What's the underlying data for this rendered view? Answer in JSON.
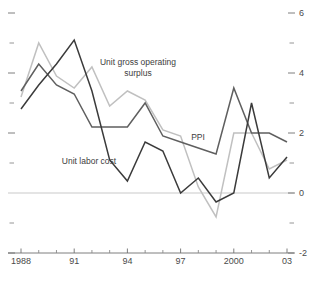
{
  "chart_data": {
    "type": "line",
    "title": "",
    "subtitle": "",
    "xlabel": "",
    "ylabel": "",
    "xlim": [
      1988,
      2003
    ],
    "ylim": [
      -2,
      6
    ],
    "grid": false,
    "legend_position": "inline-annotations",
    "x_tick_labels": [
      "1988",
      "91",
      "94",
      "97",
      "2000",
      "03"
    ],
    "x_tick_values": [
      1988,
      1991,
      1994,
      1997,
      2000,
      2003
    ],
    "x_minor_ticks": [
      1989,
      1990,
      1992,
      1993,
      1995,
      1996,
      1998,
      1999,
      2001,
      2002
    ],
    "y_tick_labels": [
      "6",
      "4",
      "2",
      "0",
      "-2"
    ],
    "y_tick_values": [
      6,
      4,
      2,
      0,
      -2
    ],
    "y_minor_ticks": [
      5,
      3,
      1,
      -1
    ],
    "x": [
      1988,
      1989,
      1990,
      1991,
      1992,
      1993,
      1994,
      1995,
      1996,
      1997,
      1998,
      1999,
      2000,
      2001,
      2002,
      2003
    ],
    "series": [
      {
        "name": "Unit gross operating surplus",
        "color": "#c0c0c0",
        "values": [
          3.2,
          5.0,
          3.9,
          3.5,
          4.2,
          2.9,
          3.4,
          3.1,
          2.1,
          1.9,
          0.2,
          -0.8,
          2.0,
          2.0,
          0.8,
          1.1
        ]
      },
      {
        "name": "Unit labor cost",
        "color": "#5f5f5f",
        "values": [
          3.4,
          4.3,
          3.6,
          3.3,
          2.2,
          2.2,
          2.2,
          3.0,
          1.9,
          1.7,
          1.5,
          1.3,
          3.5,
          2.0,
          2.0,
          1.7
        ]
      },
      {
        "name": "PPI",
        "color": "#3b3b3b",
        "values": [
          2.8,
          3.6,
          4.3,
          5.1,
          3.4,
          1.1,
          0.4,
          1.7,
          1.4,
          0.0,
          0.5,
          -0.3,
          0.0,
          3.0,
          0.5,
          1.2
        ]
      }
    ],
    "annotations": [
      {
        "text": "Unit gross operating",
        "x": 138,
        "y": 65,
        "anchor": "middle"
      },
      {
        "text": "surplus",
        "x": 138,
        "y": 76,
        "anchor": "middle"
      },
      {
        "text": "Unit labor cost",
        "x": 89,
        "y": 164,
        "anchor": "middle"
      },
      {
        "text": "PPI",
        "x": 198,
        "y": 140,
        "anchor": "middle"
      }
    ],
    "zero_line_color": "#c9c9c9",
    "axis_color": "#6f6f6f",
    "background_color": "#ffffff"
  },
  "geometry": {
    "plot_left": 21,
    "plot_right": 287,
    "y_top_px": 13,
    "y_bottom_px": 253,
    "axis_y_px": 253
  }
}
